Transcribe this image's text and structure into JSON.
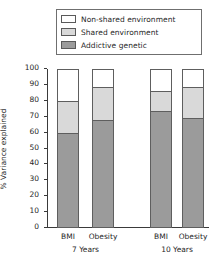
{
  "chart_data": {
    "type": "bar",
    "subtype": "stacked-bar",
    "title": "",
    "xlabel": "",
    "ylabel": "% Variance explained",
    "ylim": [
      0,
      100
    ],
    "ytick_labels": [
      "100",
      "90",
      "80",
      "70",
      "60",
      "50",
      "40",
      "30",
      "20",
      "10",
      "0"
    ],
    "ytick_values": [
      100,
      90,
      80,
      70,
      60,
      50,
      40,
      30,
      20,
      10,
      0
    ],
    "grid": false,
    "legend_position": "top",
    "categories": [
      "BMI",
      "Obesity",
      "BMI",
      "Obesity"
    ],
    "groups": [
      {
        "label": "7 Years",
        "categories": [
          "BMI",
          "Obesity"
        ]
      },
      {
        "label": "10 Years",
        "categories": [
          "BMI",
          "Obesity"
        ]
      }
    ],
    "series": [
      {
        "name": "Addictive genetic",
        "color": "#9b9b9b",
        "values": [
          60,
          68,
          74,
          69.5
        ]
      },
      {
        "name": "Shared environment",
        "color": "#d9d9d9",
        "values": [
          20.5,
          21,
          12.5,
          19.5
        ]
      },
      {
        "name": "Non-shared environment",
        "color": "#ffffff",
        "values": [
          19.5,
          11,
          13.5,
          11
        ]
      }
    ],
    "bars": [
      {
        "category": "BMI",
        "group": "7 Years",
        "addictive_genetic": 60,
        "shared_environment": 20.5,
        "non_shared_environment": 19.5,
        "boundaries": [
          60,
          80.5,
          100
        ]
      },
      {
        "category": "Obesity",
        "group": "7 Years",
        "addictive_genetic": 68,
        "shared_environment": 21,
        "non_shared_environment": 11,
        "boundaries": [
          68,
          89,
          100
        ]
      },
      {
        "category": "BMI",
        "group": "10 Years",
        "addictive_genetic": 74,
        "shared_environment": 12.5,
        "non_shared_environment": 13.5,
        "boundaries": [
          74,
          86.5,
          100
        ]
      },
      {
        "category": "Obesity",
        "group": "10 Years",
        "addictive_genetic": 69.5,
        "shared_environment": 19.5,
        "non_shared_environment": 11,
        "boundaries": [
          69.5,
          89,
          100
        ]
      }
    ]
  },
  "legend": {
    "items": [
      {
        "label": "Non-shared environment",
        "color": "#ffffff"
      },
      {
        "label": "Shared environment",
        "color": "#d9d9d9"
      },
      {
        "label": "Addictive genetic",
        "color": "#9b9b9b"
      }
    ]
  },
  "axes": {
    "y_label": "% Variance explained",
    "y_ticks": [
      "100",
      "90",
      "80",
      "70",
      "60",
      "50",
      "40",
      "30",
      "20",
      "10",
      "0"
    ],
    "x_ticks": [
      "BMI",
      "Obesity",
      "BMI",
      "Obesity"
    ],
    "x_groups": [
      "7 Years",
      "10 Years"
    ]
  },
  "colors": {
    "non_shared": "#ffffff",
    "shared": "#d9d9d9",
    "genetic": "#9b9b9b",
    "outline": "#5e5e5e",
    "axis": "#3a3a3a",
    "text": "#1f1f1f",
    "background": "#ffffff"
  }
}
